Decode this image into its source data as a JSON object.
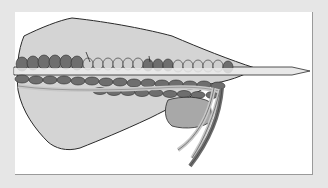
{
  "illustration": {
    "subject": "knitting-stitches-on-needle",
    "colors": {
      "background": "#e6e6e6",
      "panel": "#ffffff",
      "fabric": "#d4d4d4",
      "fabric_outline": "#2a2a2a",
      "stitch_dark": "#6e6e6e",
      "stitch_light": "#cfcfcf",
      "needle": "#e8e8e8",
      "yarn_dark": "#6e6e6e",
      "yarn_light": "#c8c8c8",
      "pocket": "#a8a8a8"
    }
  }
}
